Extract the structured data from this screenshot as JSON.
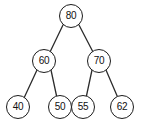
{
  "diagram": {
    "type": "binary-tree",
    "background_color": "#ffffff",
    "node_fill_color": "#ffffff",
    "node_border_color": "#1c1c1c",
    "edge_color": "#2b2b2b",
    "label_color": "#111111",
    "nodes": [
      {
        "id": "root",
        "label": "80",
        "cx": 71,
        "cy": 16,
        "r": 12,
        "font_size": 10,
        "level": 0
      },
      {
        "id": "n60",
        "label": "60",
        "cx": 44,
        "cy": 61,
        "r": 12,
        "font_size": 10,
        "level": 1
      },
      {
        "id": "n70",
        "label": "70",
        "cx": 99,
        "cy": 61,
        "r": 12,
        "font_size": 10,
        "level": 1
      },
      {
        "id": "n40",
        "label": "40",
        "cx": 18,
        "cy": 107,
        "r": 12,
        "font_size": 10,
        "level": 2
      },
      {
        "id": "n50",
        "label": "50",
        "cx": 60,
        "cy": 107,
        "r": 12,
        "font_size": 10,
        "level": 2
      },
      {
        "id": "n55",
        "label": "55",
        "cx": 83,
        "cy": 107,
        "r": 12,
        "font_size": 10,
        "level": 2
      },
      {
        "id": "n62",
        "label": "62",
        "cx": 122,
        "cy": 107,
        "r": 12,
        "font_size": 10,
        "level": 2
      }
    ],
    "edges": [
      {
        "from": "root",
        "to": "n60",
        "x1": 63,
        "y1": 25,
        "x2": 50,
        "y2": 52
      },
      {
        "from": "root",
        "to": "n70",
        "x1": 79,
        "y1": 25,
        "x2": 93,
        "y2": 52
      },
      {
        "from": "n60",
        "to": "n40",
        "x1": 37,
        "y1": 70,
        "x2": 24,
        "y2": 98
      },
      {
        "from": "n60",
        "to": "n50",
        "x1": 51,
        "y1": 70,
        "x2": 57,
        "y2": 98
      },
      {
        "from": "n70",
        "to": "n55",
        "x1": 92,
        "y1": 70,
        "x2": 86,
        "y2": 98
      },
      {
        "from": "n70",
        "to": "n62",
        "x1": 106,
        "y1": 70,
        "x2": 118,
        "y2": 98
      }
    ]
  }
}
